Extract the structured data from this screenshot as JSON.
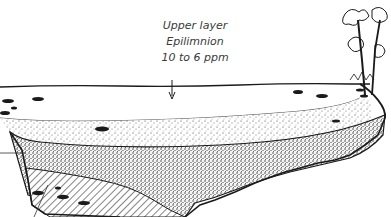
{
  "diagram": {
    "title_fragment": "",
    "labels": {
      "layer_name": "Upper layer",
      "layer_term": "Epilimnion",
      "oxygen_range": "10 to 6 ppm"
    },
    "layers": [
      {
        "name": "epilimnion",
        "fill": "#ffffff"
      },
      {
        "name": "thermocline-stipple",
        "fill": "#e9e9e9"
      },
      {
        "name": "dense-stipple",
        "fill": "#bdbdbd"
      },
      {
        "name": "hypolimnion-hatched",
        "fill": "#d0d0d0"
      }
    ],
    "colors": {
      "ink": "#1a1a1a",
      "text": "#3a3a3a",
      "background": "#ffffff"
    }
  }
}
